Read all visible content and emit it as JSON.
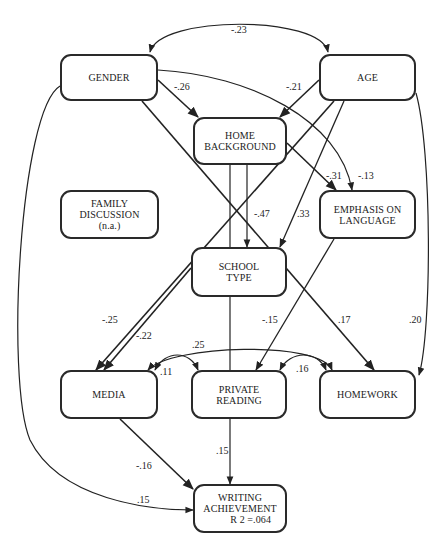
{
  "diagram": {
    "type": "path-diagram",
    "nodes": {
      "gender": {
        "label": "GENDER"
      },
      "age": {
        "label": "AGE"
      },
      "home_background": {
        "line1": "HOME",
        "line2": "BACKGROUND"
      },
      "family_discussion": {
        "line1": "FAMILY",
        "line2": "DISCUSSION",
        "note": "(n.a.)"
      },
      "emphasis_on_language": {
        "line1": "EMPHASIS ON",
        "line2": "LANGUAGE"
      },
      "school_type": {
        "line1": "SCHOOL",
        "line2": "TYPE"
      },
      "media": {
        "label": "MEDIA"
      },
      "private_reading": {
        "line1": "PRIVATE",
        "line2": "READING"
      },
      "homework": {
        "label": "HOMEWORK"
      },
      "writing_achievement": {
        "line1": "WRITING",
        "line2": "ACHIEVEMENT",
        "r2": "R 2 =.064"
      }
    },
    "coefficients": {
      "gender_age": "-.23",
      "gender_home": "-.26",
      "age_home": "-.21",
      "home_emphasis": "-.31",
      "gender_emphasis": "-.13",
      "home_school": "-.47",
      "age_school": ".33",
      "school_media_a": "-.25",
      "school_media_b": "-.22",
      "emphasis_reading": "-.15",
      "gender_homework": ".17",
      "age_homework": ".20",
      "media_homework": ".25",
      "media_reading": ".11",
      "reading_homework": ".16",
      "reading_writing": ".15",
      "media_writing": "-.16",
      "gender_writing": ".15"
    },
    "edges": [
      {
        "from": "gender",
        "to": "age",
        "type": "correlation",
        "value": "-.23"
      },
      {
        "from": "gender",
        "to": "home_background",
        "value": "-.26"
      },
      {
        "from": "age",
        "to": "home_background",
        "value": "-.21"
      },
      {
        "from": "home_background",
        "to": "emphasis_on_language",
        "value": "-.31"
      },
      {
        "from": "gender",
        "to": "emphasis_on_language",
        "value": "-.13"
      },
      {
        "from": "home_background",
        "to": "school_type",
        "value": "-.47"
      },
      {
        "from": "age",
        "to": "school_type",
        "value": ".33"
      },
      {
        "from": "age",
        "to": "media",
        "value": "-.25"
      },
      {
        "from": "school_type",
        "to": "media",
        "value": "-.22"
      },
      {
        "from": "emphasis_on_language",
        "to": "private_reading",
        "value": "-.15"
      },
      {
        "from": "gender",
        "to": "homework",
        "value": ".17"
      },
      {
        "from": "age",
        "to": "homework",
        "value": ".20"
      },
      {
        "from": "media",
        "to": "homework",
        "type": "correlation",
        "value": ".25"
      },
      {
        "from": "media",
        "to": "private_reading",
        "type": "correlation",
        "value": ".11"
      },
      {
        "from": "private_reading",
        "to": "homework",
        "type": "correlation",
        "value": ".16"
      },
      {
        "from": "private_reading",
        "to": "writing_achievement",
        "value": ".15"
      },
      {
        "from": "media",
        "to": "writing_achievement",
        "value": "-.16"
      },
      {
        "from": "gender",
        "to": "writing_achievement",
        "value": ".15"
      }
    ]
  }
}
